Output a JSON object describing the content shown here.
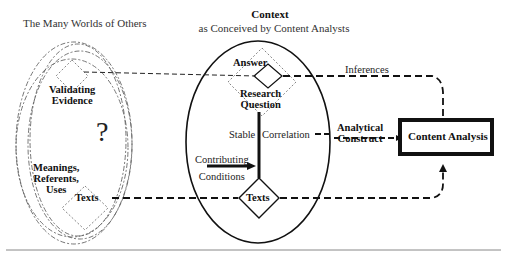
{
  "diagram": {
    "left_region": {
      "title": "The Many Worlds of Others",
      "validating_evidence": "Validating Evidence",
      "validating_evidence_lines": [
        "Validating",
        "Evidence"
      ],
      "unknown_mark": "?",
      "meanings_lines": [
        "Meanings,",
        "Referents,",
        "Uses"
      ],
      "texts": "Texts"
    },
    "context_region": {
      "title": "Context",
      "subtitle": "as Conceived by Content Analysts",
      "answer": "Answer",
      "research_question_lines": [
        "Research",
        "Question"
      ],
      "stable": "Stable",
      "correlation": "Correlation",
      "contributing_conditions_lines": [
        "Contributing",
        "Conditions"
      ],
      "texts": "Texts"
    },
    "right_region": {
      "inferences": "Inferences",
      "analytical_construct_lines": [
        "Analytical",
        "Construct"
      ],
      "content_analysis": "Content Analysis"
    },
    "colors": {
      "line": "#111111",
      "dotted": "#666666",
      "rule": "#888888"
    }
  }
}
